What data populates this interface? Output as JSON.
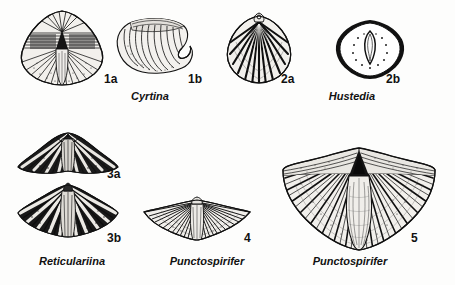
{
  "plate": {
    "background_color": "#fdfdfc",
    "ink_color": "#111111",
    "description": "Black and white scientific illustration plate of fossil brachiopod shells"
  },
  "figures": [
    {
      "id": "1a",
      "number_label": "1a",
      "genus": "Cyrtina",
      "view": "ventral view of shell with high interarea and median fold",
      "number_pos": {
        "x": 104,
        "y": 73
      },
      "art_pos": {
        "x": 16,
        "y": 8,
        "w": 92,
        "h": 80
      }
    },
    {
      "id": "1b",
      "number_label": "1b",
      "genus": "Cyrtina",
      "view": "lateral view showing strongly curved hook-shaped beak",
      "number_pos": {
        "x": 188,
        "y": 73
      },
      "art_pos": {
        "x": 112,
        "y": 12,
        "w": 84,
        "h": 70
      }
    },
    {
      "id": "2a",
      "number_label": "2a",
      "genus": "Hustedia",
      "view": "exterior view with coarse radial ribs and small pedicle foramen",
      "number_pos": {
        "x": 281,
        "y": 73
      },
      "art_pos": {
        "x": 222,
        "y": 10,
        "w": 74,
        "h": 76
      }
    },
    {
      "id": "2b",
      "number_label": "2b",
      "genus": "Hustedia",
      "view": "outline of shell cross section with internal teardrop structure and stipple",
      "number_pos": {
        "x": 386,
        "y": 73
      },
      "art_pos": {
        "x": 334,
        "y": 18,
        "w": 72,
        "h": 62
      }
    },
    {
      "id": "3a",
      "number_label": "3a",
      "genus": "Reticulariina",
      "view": "anterior view of shell, dark spinose ornament",
      "number_pos": {
        "x": 107,
        "y": 168
      },
      "art_pos": {
        "x": 16,
        "y": 131,
        "w": 104,
        "h": 46
      }
    },
    {
      "id": "3b",
      "number_label": "3b",
      "genus": "Reticulariina",
      "view": "dorsal fan-shaped view with radiating ribs and spine bases",
      "number_pos": {
        "x": 107,
        "y": 232
      },
      "art_pos": {
        "x": 16,
        "y": 183,
        "w": 104,
        "h": 56
      }
    },
    {
      "id": "4",
      "number_label": "4",
      "genus": "Punctospirifer",
      "view": "broad winged shell with fine radial plications",
      "number_pos": {
        "x": 244,
        "y": 232
      },
      "art_pos": {
        "x": 143,
        "y": 196,
        "w": 108,
        "h": 48
      }
    },
    {
      "id": "5",
      "number_label": "5",
      "genus": "Punctospirifer",
      "view": "large butterfly-shaped shell with median sulcus and strong ribs",
      "number_pos": {
        "x": 411,
        "y": 232
      },
      "art_pos": {
        "x": 281,
        "y": 140,
        "w": 156,
        "h": 112
      }
    }
  ],
  "genus_captions": [
    {
      "name": "Cyrtina",
      "x": 150,
      "y": 97
    },
    {
      "name": "Hustedia",
      "x": 352,
      "y": 97
    },
    {
      "name": "Reticulariina",
      "x": 72,
      "y": 261
    },
    {
      "name": "Punctospirifer",
      "x": 207,
      "y": 261
    },
    {
      "name": "Punctospirifer",
      "x": 350,
      "y": 261
    }
  ]
}
